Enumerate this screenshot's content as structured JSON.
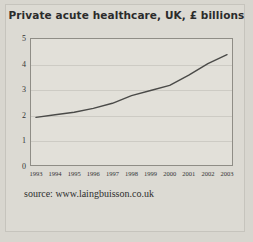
{
  "chart_data": {
    "type": "line",
    "title": "Private acute healthcare, UK, £ billions",
    "xlabel": "",
    "ylabel": "",
    "categories": [
      "1993",
      "1994",
      "1995",
      "1996",
      "1997",
      "1998",
      "1999",
      "2000",
      "2001",
      "2002",
      "2003"
    ],
    "values": [
      1.9,
      2.0,
      2.1,
      2.25,
      2.45,
      2.75,
      2.95,
      3.15,
      3.55,
      4.0,
      4.35
    ],
    "series": [
      {
        "name": "Private acute healthcare",
        "values": [
          1.9,
          2.0,
          2.1,
          2.25,
          2.45,
          2.75,
          2.95,
          3.15,
          3.55,
          4.0,
          4.35
        ]
      }
    ],
    "ylim": [
      0,
      5
    ],
    "yticks": [
      "0",
      "1",
      "2",
      "3",
      "4",
      "5"
    ],
    "ytick_values": [
      0,
      1,
      2,
      3,
      4,
      5
    ],
    "grid": true,
    "legend": false,
    "line_color": "#4a4a48",
    "plot_background": "#e2e0d9",
    "figure_background": "#d8d6cf"
  },
  "figure": {
    "title": "Private acute healthcare, UK, £ billions",
    "source_note": "source: www.laingbuisson.co.uk"
  }
}
